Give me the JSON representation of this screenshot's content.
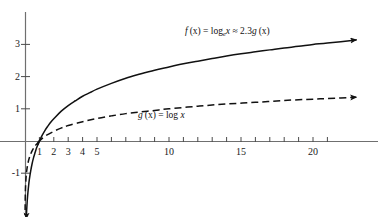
{
  "chart_data": {
    "type": "line",
    "title": "",
    "xlabel": "",
    "ylabel": "",
    "xlim": [
      -0.4,
      22.0
    ],
    "ylim": [
      -2.4,
      3.7
    ],
    "grid": false,
    "legend_position": "inline-annotation",
    "x_ticks_major": [
      1,
      2,
      3,
      4,
      5,
      10,
      15,
      20
    ],
    "x_ticks_all": [
      1,
      2,
      3,
      4,
      5,
      6,
      7,
      8,
      9,
      10,
      11,
      12,
      13,
      14,
      15,
      16,
      17,
      18,
      19,
      20,
      21
    ],
    "x_tick_labels": [
      "1",
      "2",
      "3",
      "4",
      "5",
      "10",
      "15",
      "20"
    ],
    "y_ticks": [
      -1,
      1,
      2,
      3
    ],
    "y_tick_labels": [
      "-1",
      "1",
      "2",
      "3"
    ],
    "series": [
      {
        "name": "f(x) = log_e x",
        "style": "solid",
        "color": "#111111",
        "arrow_end": true,
        "x": [
          0.09,
          0.12,
          0.16,
          0.2,
          0.25,
          0.3,
          0.4,
          0.5,
          0.6,
          0.7,
          0.8,
          0.9,
          1.0,
          1.2,
          1.4,
          1.6,
          1.8,
          2.0,
          2.5,
          3.0,
          3.5,
          4.0,
          4.5,
          5.0,
          6.0,
          7.0,
          8.0,
          9.0,
          10.0,
          11.0,
          12.0,
          13.0,
          14.0,
          15.0,
          16.0,
          17.0,
          18.0,
          19.0,
          20.0,
          21.0,
          23.0
        ],
        "y": [
          -2.41,
          -2.12,
          -1.83,
          -1.61,
          -1.39,
          -1.2,
          -0.92,
          -0.69,
          -0.51,
          -0.36,
          -0.22,
          -0.11,
          0.0,
          0.18,
          0.34,
          0.47,
          0.59,
          0.69,
          0.92,
          1.1,
          1.25,
          1.39,
          1.5,
          1.61,
          1.79,
          1.95,
          2.08,
          2.2,
          2.3,
          2.4,
          2.48,
          2.56,
          2.64,
          2.71,
          2.77,
          2.83,
          2.89,
          2.94,
          3.0,
          3.04,
          3.14
        ]
      },
      {
        "name": "g(x) = log x",
        "style": "dashed",
        "color": "#111111",
        "arrow_end": true,
        "x": [
          0.005,
          0.008,
          0.012,
          0.02,
          0.03,
          0.05,
          0.08,
          0.12,
          0.2,
          0.3,
          0.4,
          0.5,
          0.6,
          0.7,
          0.8,
          0.9,
          1.0,
          1.2,
          1.5,
          2.0,
          2.5,
          3.0,
          4.0,
          5.0,
          6.0,
          7.0,
          8.0,
          9.0,
          10.0,
          12.0,
          14.0,
          16.0,
          18.0,
          20.0,
          21.0,
          23.0
        ],
        "y": [
          -2.3,
          -2.1,
          -1.92,
          -1.7,
          -1.52,
          -1.3,
          -1.1,
          -0.92,
          -0.7,
          -0.52,
          -0.4,
          -0.3,
          -0.22,
          -0.15,
          -0.1,
          -0.05,
          0.0,
          0.08,
          0.18,
          0.3,
          0.4,
          0.48,
          0.6,
          0.7,
          0.78,
          0.85,
          0.9,
          0.95,
          1.0,
          1.08,
          1.15,
          1.2,
          1.26,
          1.3,
          1.32,
          1.36
        ]
      }
    ],
    "annotations": [
      {
        "name": "f-curve-label",
        "text": "f (x) = log_e x ≈ 2.3 g (x)",
        "parts": {
          "fx": "f",
          "arg1": "(x)",
          "eq": "=",
          "log": "log",
          "base": "e",
          "var": "x",
          "approx": "≈",
          "coef": "2.3",
          "gx": "g",
          "arg2": "(x)"
        },
        "x_px": 185,
        "y_px": 27
      },
      {
        "name": "g-curve-label",
        "text": "g (x) = log x",
        "parts": {
          "gx": "g",
          "arg1": "(x)",
          "eq": "=",
          "log": "log",
          "var": "x"
        },
        "x_px": 138,
        "y_px": 111
      }
    ],
    "axis": {
      "origin_px": [
        25,
        141
      ],
      "x_scale_px_per_unit": 14.4,
      "y_scale_px_per_unit": 32.2,
      "x_axis_color": "#6f6f6f",
      "y_axis_color": "#6f6f6f"
    }
  },
  "colors": {
    "background": "#ffffff",
    "ink": "#111111",
    "axis": "#6f6f6f",
    "tick_text": "#1a1a1a"
  }
}
